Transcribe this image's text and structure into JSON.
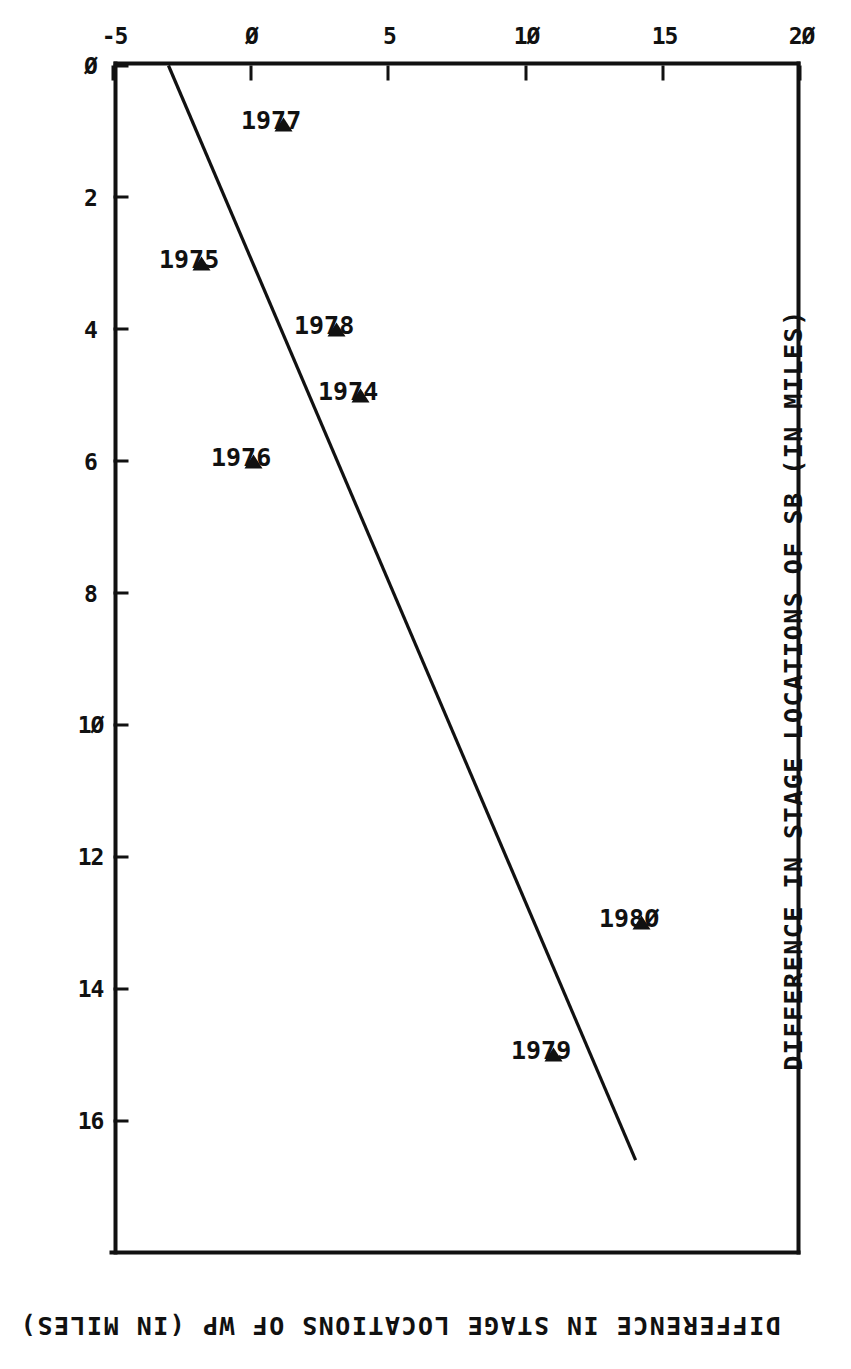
{
  "figure": {
    "background_color": "#ffffff",
    "ink_color": "#111111",
    "orientation": "rotated-90-clockwise"
  },
  "chart_data": {
    "type": "scatter",
    "title": "",
    "xlabel": "DIFFERENCE IN STAGE LOCATIONS OF SB (IN MILES)",
    "ylabel": "DIFFERENCE IN STAGE LOCATIONS OF WP (IN MILES)",
    "xlim": [
      0,
      18
    ],
    "ylim": [
      -5,
      20
    ],
    "xticks": [
      0,
      2,
      4,
      6,
      8,
      10,
      12,
      14,
      16
    ],
    "xticklabels": [
      "Ø",
      "2",
      "4",
      "6",
      "8",
      "1Ø",
      "12",
      "14",
      "16"
    ],
    "yticks": [
      -5,
      0,
      5,
      10,
      15,
      20
    ],
    "yticklabels": [
      "-5",
      "Ø",
      "5",
      "1Ø",
      "15",
      "2Ø"
    ],
    "grid": false,
    "legend": null,
    "marker_style": "open-triangle",
    "points": [
      {
        "label": "1977",
        "x": 0.9,
        "y": 1.2
      },
      {
        "label": "1975",
        "x": 3.0,
        "y": -1.8
      },
      {
        "label": "1978",
        "x": 4.0,
        "y": 3.1
      },
      {
        "label": "1974",
        "x": 5.0,
        "y": 4.0
      },
      {
        "label": "1976",
        "x": 6.0,
        "y": 0.1
      },
      {
        "label": "198Ø",
        "x": 13.0,
        "y": 14.2
      },
      {
        "label": "1979",
        "x": 15.0,
        "y": 11.0
      }
    ],
    "trendline": {
      "type": "linear-fit",
      "x_start": 0.0,
      "y_start": -3.0,
      "x_end": 16.6,
      "y_end": 14.0
    }
  }
}
